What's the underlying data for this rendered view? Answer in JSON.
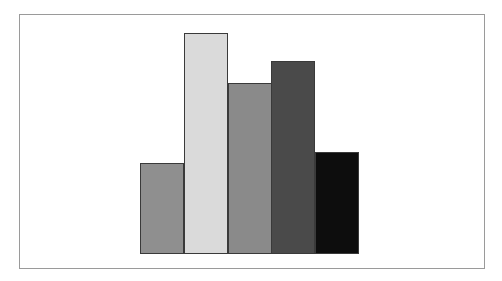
{
  "chart_data": {
    "type": "bar",
    "title": "",
    "xlabel": "",
    "ylabel": "",
    "categories": [
      "1",
      "2",
      "3",
      "4",
      "5"
    ],
    "values": [
      91,
      221,
      171,
      193,
      102
    ],
    "ylim": [
      0,
      240
    ],
    "grid": false,
    "legend": null,
    "colors": [
      "#8f8f8f",
      "#dadada",
      "#8a8a8a",
      "#4a4a4a",
      "#0d0d0d"
    ],
    "frame_color": "#9a9a9a",
    "bar_edge_color": "#3a3a3a"
  }
}
